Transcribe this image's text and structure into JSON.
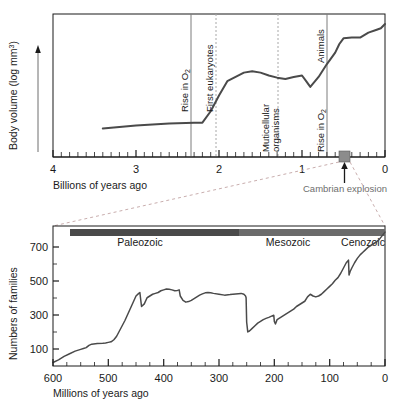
{
  "figure": {
    "title_hidden": "Body volume and family diversity through geological time"
  },
  "top_panel": {
    "y_axis": {
      "label_main": "Body volume (log mm",
      "label_sup": "3",
      "label_close": ")",
      "arrow": "up-arrow-icon"
    },
    "x_axis": {
      "label": "Billions of years ago",
      "ticks": [
        "4",
        "3",
        "2",
        "1",
        "0"
      ],
      "tick_values": [
        4,
        3,
        2,
        1,
        0
      ],
      "minor_step": 0.1,
      "range": [
        4,
        0
      ]
    },
    "events": [
      {
        "name": "rise-in-o2-first",
        "label_main": "Rise in O",
        "label_sub": "2",
        "at_ga": 2.3,
        "line": "solid"
      },
      {
        "name": "first-eukaryotes",
        "label_main": "First eukaryotes",
        "label_sub": "",
        "at_ga": 2.0,
        "line": "dashed"
      },
      {
        "name": "multicellular-organisms",
        "label_main": "Muticellular organisms",
        "label_sub": "",
        "at_ga": 1.25,
        "line": "dashed"
      },
      {
        "name": "rise-in-o2-second",
        "label_main": "Rise in O",
        "label_sub": "2",
        "at_ga": 0.7,
        "line": "solid"
      },
      {
        "name": "animals",
        "label_main": "Animals",
        "label_sub": "",
        "at_ga": 0.7,
        "line": "none"
      }
    ],
    "cambrian": {
      "label": "Cambrian explosion",
      "marker": "cambrian-box",
      "at_ga": 0.54,
      "arrow": "up-arrow-icon"
    }
  },
  "bottom_panel": {
    "y_axis": {
      "label": "Numbers of families",
      "ticks": [
        "100",
        "300",
        "500",
        "700"
      ],
      "tick_values": [
        100,
        300,
        500,
        700
      ],
      "minor_values": [
        200,
        400,
        600
      ],
      "range": [
        0,
        800
      ]
    },
    "x_axis": {
      "label": "Millions of years ago",
      "ticks": [
        "600",
        "500",
        "400",
        "300",
        "200",
        "100",
        "0"
      ],
      "tick_values": [
        600,
        500,
        400,
        300,
        200,
        100,
        0
      ],
      "minor_step": 25,
      "range": [
        600,
        0
      ]
    },
    "eras": [
      {
        "name": "paleozoic",
        "label": "Paleozoic",
        "start_ma": 542,
        "end_ma": 251,
        "color": "#4a4a4a"
      },
      {
        "name": "mesozoic",
        "label": "Mesozoic",
        "start_ma": 251,
        "end_ma": 65,
        "color": "#6b6b6b"
      },
      {
        "name": "cenozoic",
        "label": "Cenozoic",
        "start_ma": 65,
        "end_ma": 0,
        "color": "#6b6b6b"
      }
    ]
  },
  "colors": {
    "curve": "#4a4a4a",
    "axis": "#1a1a1a",
    "event_line_solid": "#7d7d7d",
    "event_line_dashed": "#a8a8a8",
    "connector": "#c2a8a8",
    "era_dark": "#4a4a4a",
    "era_light": "#6b6b6b",
    "cambrian_text": "#6e6e6e"
  },
  "chart_data": [
    {
      "type": "line",
      "name": "body-volume-vs-time",
      "title": "Body volume (log mm3) vs billions of years ago",
      "xlabel": "Billions of years ago",
      "ylabel": "Body volume (log mm3)",
      "xlim": [
        4,
        0
      ],
      "ylim": [
        0,
        10
      ],
      "grid": false,
      "legend": "none",
      "x": [
        3.4,
        3.0,
        2.6,
        2.3,
        2.2,
        2.1,
        2.0,
        1.9,
        1.8,
        1.7,
        1.6,
        1.5,
        1.4,
        1.3,
        1.2,
        1.1,
        1.0,
        0.95,
        0.9,
        0.8,
        0.7,
        0.6,
        0.55,
        0.5,
        0.4,
        0.3,
        0.2,
        0.1,
        0.05,
        0.0
      ],
      "y": [
        2.0,
        2.2,
        2.35,
        2.4,
        2.4,
        3.2,
        4.3,
        5.3,
        5.6,
        5.9,
        6.0,
        5.9,
        5.7,
        5.55,
        5.45,
        5.6,
        5.7,
        5.3,
        4.9,
        5.6,
        6.5,
        7.3,
        7.9,
        8.3,
        8.35,
        8.35,
        8.7,
        8.9,
        9.0,
        9.3
      ],
      "annotations": [
        {
          "text": "Rise in O2",
          "x": 2.3
        },
        {
          "text": "First eukaryotes",
          "x": 2.0
        },
        {
          "text": "Muticellular organisms",
          "x": 1.25
        },
        {
          "text": "Rise in O2",
          "x": 0.7
        },
        {
          "text": "Animals",
          "x": 0.7
        },
        {
          "text": "Cambrian explosion",
          "x": 0.54
        }
      ]
    },
    {
      "type": "line",
      "name": "family-diversity-vs-time",
      "title": "Numbers of families vs millions of years ago",
      "xlabel": "Millions of years ago",
      "ylabel": "Numbers of families",
      "xlim": [
        600,
        0
      ],
      "ylim": [
        0,
        800
      ],
      "grid": false,
      "legend": "none",
      "x": [
        600,
        590,
        580,
        570,
        560,
        550,
        545,
        540,
        535,
        530,
        520,
        510,
        505,
        500,
        495,
        490,
        485,
        480,
        470,
        460,
        450,
        445,
        443,
        440,
        435,
        430,
        425,
        420,
        415,
        410,
        405,
        400,
        395,
        390,
        385,
        380,
        375,
        372,
        370,
        365,
        360,
        355,
        350,
        345,
        340,
        335,
        330,
        325,
        320,
        315,
        310,
        300,
        290,
        280,
        270,
        260,
        255,
        252,
        251,
        250,
        248,
        245,
        240,
        235,
        230,
        225,
        220,
        215,
        210,
        205,
        201,
        200,
        198,
        195,
        190,
        185,
        180,
        175,
        170,
        165,
        160,
        155,
        150,
        145,
        140,
        135,
        130,
        125,
        120,
        115,
        110,
        105,
        100,
        95,
        90,
        85,
        80,
        75,
        70,
        66,
        65,
        63,
        60,
        55,
        50,
        45,
        40,
        35,
        30,
        25,
        20,
        15,
        10,
        5,
        0
      ],
      "y": [
        20,
        35,
        55,
        70,
        85,
        95,
        100,
        105,
        118,
        125,
        128,
        130,
        132,
        135,
        138,
        150,
        170,
        200,
        260,
        330,
        400,
        415,
        420,
        340,
        355,
        390,
        400,
        410,
        415,
        420,
        430,
        435,
        440,
        438,
        435,
        430,
        432,
        435,
        400,
        375,
        365,
        368,
        375,
        385,
        395,
        405,
        412,
        418,
        420,
        418,
        415,
        410,
        405,
        408,
        412,
        415,
        410,
        400,
        390,
        250,
        195,
        200,
        215,
        230,
        245,
        255,
        265,
        272,
        278,
        285,
        290,
        255,
        240,
        265,
        275,
        285,
        295,
        305,
        315,
        325,
        340,
        350,
        360,
        370,
        395,
        410,
        400,
        395,
        400,
        410,
        425,
        440,
        455,
        470,
        490,
        505,
        530,
        560,
        590,
        605,
        520,
        540,
        560,
        590,
        615,
        635,
        650,
        665,
        680,
        690,
        700,
        710,
        725,
        745,
        765
      ]
    }
  ]
}
